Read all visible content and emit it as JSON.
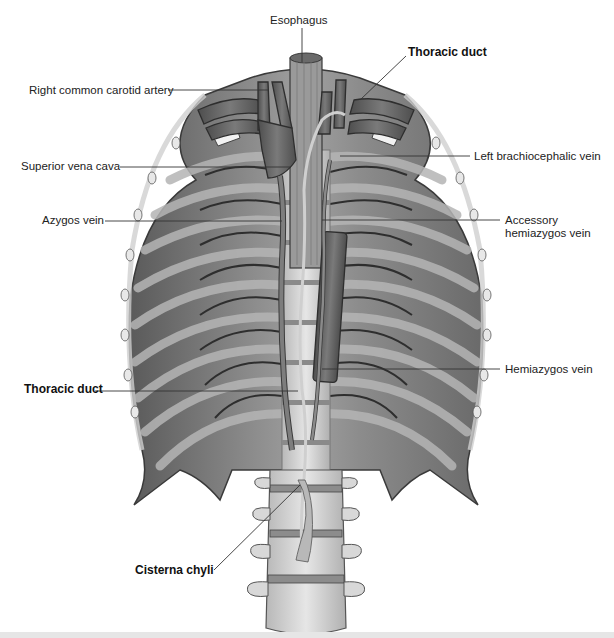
{
  "figure": {
    "type": "anatomical-illustration",
    "colors": {
      "background": "#ffffff",
      "rib_cage": "#8a8a8a",
      "rib_cage_dark": "#5e5e5e",
      "vessel": "#6b6b6b",
      "vessel_outline": "#2e2e2e",
      "spine": "#d4d4d4",
      "leader_line": "#333333",
      "bottom_bar": "#e6e6e6"
    }
  },
  "labels": {
    "esophagus": {
      "text": "Esophagus",
      "bold": false
    },
    "thoracic_duct_top": {
      "text": "Thoracic duct",
      "bold": true
    },
    "right_common_carotid_artery": {
      "text": "Right common carotid artery",
      "bold": false
    },
    "superior_vena_cava": {
      "text": "Superior vena cava",
      "bold": false
    },
    "left_brachiocephalic_vein": {
      "text": "Left brachiocephalic vein",
      "bold": false
    },
    "azygos_vein": {
      "text": "Azygos vein",
      "bold": false
    },
    "accessory_hemiazygos_vein_line1": {
      "text": "Accessory",
      "bold": false
    },
    "accessory_hemiazygos_vein_line2": {
      "text": "hemiazygos vein",
      "bold": false
    },
    "hemiazygos_vein": {
      "text": "Hemiazygos vein",
      "bold": false
    },
    "thoracic_duct_left": {
      "text": "Thoracic duct",
      "bold": true
    },
    "cisterna_chyli": {
      "text": "Cisterna chyli",
      "bold": true
    }
  }
}
